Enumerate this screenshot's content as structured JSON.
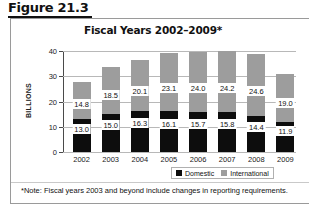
{
  "figure": {
    "label": "Figure 21.3"
  },
  "chart_data": {
    "type": "bar",
    "subtype": "stacked-column",
    "title": "Fiscal Years 2002–2009*",
    "xlabel": "",
    "ylabel": "BILLIONS",
    "ylim": [
      0,
      40
    ],
    "yticks": [
      0,
      10,
      20,
      30,
      40
    ],
    "ytick_labels": [
      "0",
      "10",
      "20",
      "30",
      "40"
    ],
    "grid": true,
    "legend_position": "bottom-right",
    "categories": [
      "2002",
      "2003",
      "2004",
      "2005",
      "2006",
      "2007",
      "2008",
      "2009"
    ],
    "series": [
      {
        "name": "Domestic",
        "color": "#0d0d0d",
        "values": [
          13.0,
          15.0,
          16.3,
          16.1,
          15.7,
          15.8,
          14.4,
          11.9
        ],
        "labels": [
          "13.0",
          "15.0",
          "16.3",
          "16.1",
          "15.7",
          "15.8",
          "14.4",
          "11.9"
        ]
      },
      {
        "name": "International",
        "color": "#9d9d9d",
        "values": [
          14.8,
          18.5,
          20.1,
          23.1,
          24.0,
          24.2,
          24.6,
          19.0
        ],
        "labels": [
          "14.8",
          "18.5",
          "20.1",
          "23.1",
          "24.0",
          "24.2",
          "24.6",
          "19.0"
        ]
      }
    ],
    "totals": [
      27.8,
      33.5,
      36.4,
      39.2,
      39.7,
      40.0,
      39.0,
      30.9
    ],
    "annotations": [
      "*Note: Fiscal years 2003 and beyond include changes in reporting requirements."
    ]
  },
  "legend": {
    "items": [
      {
        "label": "Domestic"
      },
      {
        "label": "International"
      }
    ]
  },
  "footnote": {
    "text": "*Note: Fiscal years 2003 and beyond include changes in reporting requirements."
  }
}
